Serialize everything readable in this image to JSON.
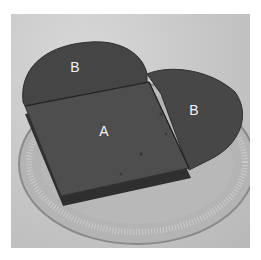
{
  "image": {
    "description": "Heart-shaped dark cake cut into a square piece and two rounded pieces on a clear ridged glass plate",
    "labels": [
      {
        "id": "left-lobe",
        "text": "B",
        "x": 75,
        "y": 67
      },
      {
        "id": "center-square",
        "text": "A",
        "x": 104,
        "y": 131
      },
      {
        "id": "right-lobe",
        "text": "B",
        "x": 194,
        "y": 110
      }
    ],
    "colors": {
      "background": "#c8c8c8",
      "cake": "#4a4a4a",
      "cake_dark": "#3a3a3a",
      "cake_edge": "#2e2e2e",
      "plate": "#a8a8a8",
      "label": "#f2f2f2"
    }
  }
}
